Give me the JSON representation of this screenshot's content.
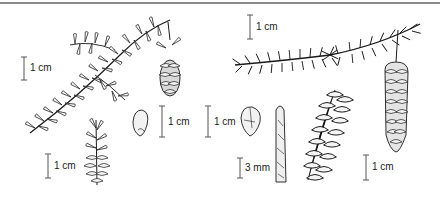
{
  "figure": {
    "panels": [
      {
        "id": "left-species",
        "parts": [
          "branch",
          "seed-cone",
          "seed",
          "pollen-cone"
        ],
        "scale_bars": [
          {
            "label": "1 cm",
            "for": "branch"
          },
          {
            "label": "1 cm",
            "for": "seed"
          },
          {
            "label": "1 cm",
            "for": "pollen-cone"
          }
        ]
      },
      {
        "id": "right-species",
        "parts": [
          "branch",
          "seed",
          "shoot",
          "open-cone",
          "closed-cone"
        ],
        "scale_bars": [
          {
            "label": "1 cm",
            "for": "branch"
          },
          {
            "label": "1 cm",
            "for": "seed"
          },
          {
            "label": "3 mm",
            "for": "shoot"
          },
          {
            "label": "1 cm",
            "for": "cone"
          }
        ]
      }
    ]
  },
  "labels": {
    "left_branch_scale": "1 cm",
    "left_seed_scale": "1 cm",
    "left_pollen_scale": "1 cm",
    "right_branch_scale": "1 cm",
    "right_seed_scale": "1 cm",
    "right_shoot_scale": "3 mm",
    "right_cone_scale": "1 cm"
  },
  "colors": {
    "ink": "#1a1a1a",
    "rule": "#8a8a8a",
    "background": "#ffffff"
  }
}
